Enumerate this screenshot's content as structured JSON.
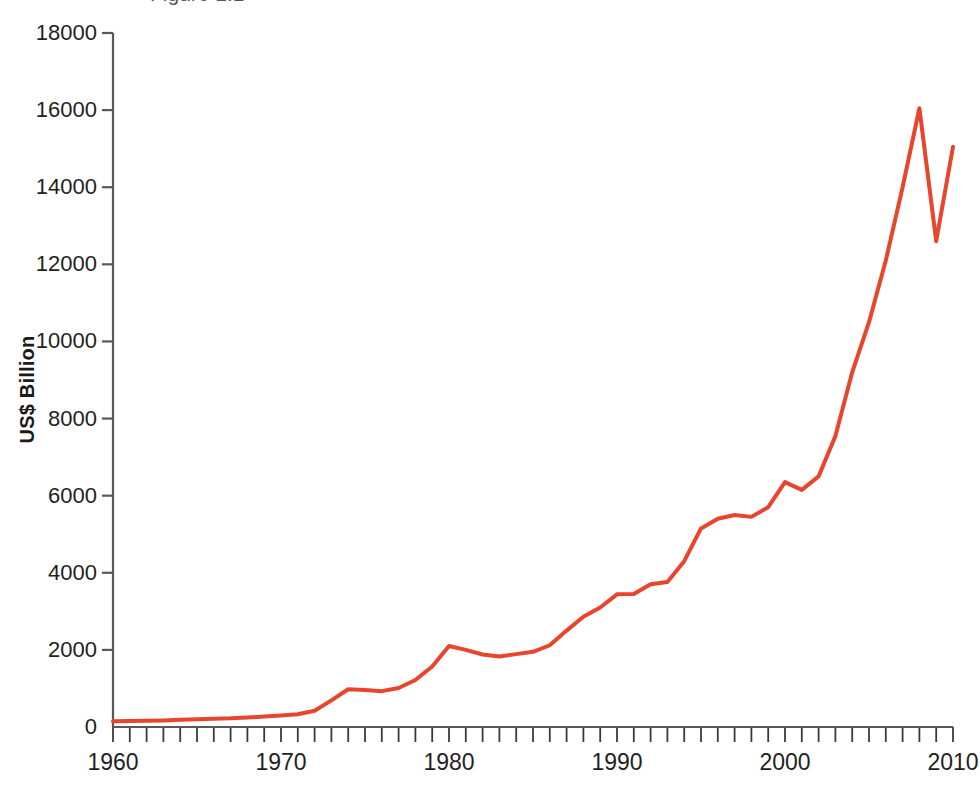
{
  "chart_data": {
    "type": "line",
    "title": "",
    "xlabel": "",
    "ylabel": "US$ Billion",
    "xlim": [
      1960,
      2010
    ],
    "ylim": [
      0,
      18000
    ],
    "ytick_labels": [
      "18000",
      "16000",
      "14000",
      "12000",
      "10000",
      "8000",
      "6000",
      "4000",
      "2000",
      "0"
    ],
    "yticks": [
      18000,
      16000,
      14000,
      12000,
      10000,
      8000,
      6000,
      4000,
      2000,
      0
    ],
    "xtick_labels": [
      "1960",
      "1970",
      "1980",
      "1990",
      "2000",
      "2010"
    ],
    "xticks": [
      1960,
      1970,
      1980,
      1990,
      2000,
      2010
    ],
    "minor_xtick_interval": 1,
    "grid": false,
    "legend": null,
    "series": [
      {
        "name": "US$ Billion",
        "color": "#e8452c",
        "x": [
          1960,
          1961,
          1962,
          1963,
          1964,
          1965,
          1966,
          1967,
          1968,
          1969,
          1970,
          1971,
          1972,
          1973,
          1974,
          1975,
          1976,
          1977,
          1978,
          1979,
          1980,
          1981,
          1982,
          1983,
          1984,
          1985,
          1986,
          1987,
          1988,
          1989,
          1990,
          1991,
          1992,
          1993,
          1994,
          1995,
          1996,
          1997,
          1998,
          1999,
          2000,
          2001,
          2002,
          2003,
          2004,
          2005,
          2006,
          2007,
          2008,
          2009,
          2010
        ],
        "values": [
          150,
          155,
          162,
          170,
          185,
          200,
          215,
          225,
          245,
          270,
          300,
          330,
          420,
          690,
          980,
          960,
          930,
          1010,
          1220,
          1570,
          2100,
          2000,
          1880,
          1830,
          1890,
          1950,
          2120,
          2500,
          2860,
          3100,
          3440,
          3450,
          3700,
          3760,
          4300,
          5150,
          5400,
          5500,
          5450,
          5700,
          6350,
          6150,
          6500,
          7550,
          9200,
          10500,
          12100,
          14000,
          16050,
          12600,
          15050
        ]
      }
    ]
  },
  "axis": {
    "y_title": "US$ Billion"
  },
  "top_clipped_text": "Figure 1.1"
}
